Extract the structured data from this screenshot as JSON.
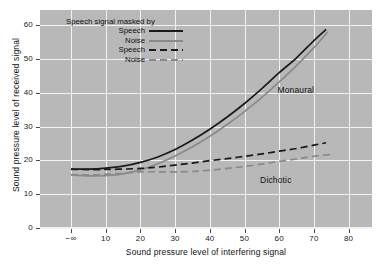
{
  "chart_data": {
    "type": "line",
    "title": "",
    "xlabel": "Sound pressure level of interfering signal",
    "ylabel": "Sound pressure level of received signal",
    "xlim": [
      -10,
      85
    ],
    "ylim": [
      0,
      63
    ],
    "xticks": [
      "−∞",
      "10",
      "20",
      "30",
      "40",
      "50",
      "60",
      "70",
      "80"
    ],
    "xtick_values": [
      0,
      10,
      20,
      30,
      40,
      50,
      60,
      70,
      80
    ],
    "yticks": [
      "0",
      "10",
      "20",
      "30",
      "40",
      "50",
      "60"
    ],
    "ytick_values": [
      0,
      10,
      20,
      30,
      40,
      50,
      60
    ],
    "grid": true,
    "legend_position": "upper-left-inside",
    "legend_title": "Speech signal masked by",
    "plot_bg": "#b8b8b8",
    "grid_color": "#f2f2f2",
    "series": [
      {
        "name": "Speech",
        "group": "Monaural",
        "style": "solid",
        "color": "#1a1a1a",
        "width": 1.7,
        "x": [
          0,
          5,
          10,
          15,
          20,
          25,
          30,
          35,
          40,
          45,
          50,
          55,
          60,
          65,
          70,
          73.5
        ],
        "y": [
          17.4,
          17.4,
          17.7,
          18.3,
          19.4,
          21.0,
          23.2,
          26.0,
          29.2,
          32.8,
          36.8,
          41.2,
          45.9,
          50.3,
          55.4,
          58.7
        ]
      },
      {
        "name": "Noise",
        "group": "Monaural",
        "style": "solid",
        "color": "#8a8a8a",
        "width": 1.7,
        "x": [
          0,
          5,
          10,
          15,
          20,
          25,
          30,
          35,
          40,
          45,
          50,
          55,
          60,
          65,
          70,
          74
        ],
        "y": [
          15.7,
          15.4,
          15.5,
          16.0,
          17.2,
          19.0,
          21.3,
          24.0,
          27.1,
          30.6,
          34.4,
          38.6,
          43.2,
          48.0,
          53.3,
          58.0
        ]
      },
      {
        "name": "Speech",
        "group": "Dichotic",
        "style": "dashed",
        "color": "#1a1a1a",
        "width": 1.7,
        "x": [
          0,
          10,
          20,
          25,
          30,
          35,
          40,
          45,
          50,
          55,
          60,
          65,
          70,
          73.5
        ],
        "y": [
          17.3,
          17.3,
          17.6,
          18.0,
          18.6,
          19.2,
          19.9,
          20.5,
          21.2,
          21.9,
          22.7,
          23.5,
          24.5,
          25.2
        ]
      },
      {
        "name": "Noise",
        "group": "Dichotic",
        "style": "dashed",
        "color": "#8a8a8a",
        "width": 1.7,
        "x": [
          0,
          5,
          10,
          15,
          20,
          25,
          30,
          35,
          40,
          45,
          50,
          55,
          60,
          65,
          70,
          75.5
        ],
        "y": [
          15.8,
          15.7,
          15.9,
          16.2,
          16.6,
          16.6,
          16.6,
          16.7,
          17.1,
          17.6,
          18.2,
          18.9,
          19.7,
          20.4,
          21.2,
          21.8
        ]
      }
    ],
    "annotations": [
      {
        "text": "Monaural",
        "x": 59.5,
        "y": 40.5
      },
      {
        "text": "Dichotic",
        "x": 54.5,
        "y": 14.0
      }
    ]
  },
  "legend": {
    "title": "Speech signal masked by",
    "entries": [
      {
        "label": "Speech",
        "style": "solid",
        "color": "#1a1a1a"
      },
      {
        "label": "Noise",
        "style": "solid",
        "color": "#8a8a8a"
      },
      {
        "label": "Speech",
        "style": "dashed",
        "color": "#1a1a1a"
      },
      {
        "label": "Noise",
        "style": "dashed",
        "color": "#8a8a8a"
      }
    ]
  }
}
